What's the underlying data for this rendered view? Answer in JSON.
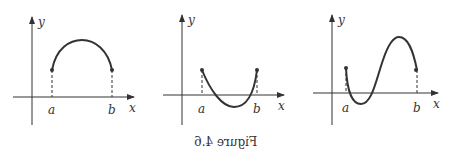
{
  "figure": {
    "caption": "Figure 4.6",
    "caption_mirrored": true,
    "panels": [
      {
        "y_label": "y",
        "x_label": "x",
        "a_label": "a",
        "b_label": "b",
        "shape": "arch above x-axis (concave down)"
      },
      {
        "y_label": "y",
        "x_label": "x",
        "a_label": "a",
        "b_label": "b",
        "shape": "U-shape dipping below x-axis (concave up)"
      },
      {
        "y_label": "y",
        "x_label": "x",
        "a_label": "a",
        "b_label": "b",
        "shape": "S-curve: dips below then rises above x-axis"
      }
    ]
  }
}
